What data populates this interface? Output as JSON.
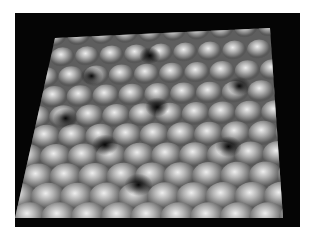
{
  "image": {
    "description": "3D rendered surface topography showing a lattice of rounded bumps with dark pits, grayscale, on black background",
    "background_color": "#050505",
    "surface_base_color": "#6e6e6e",
    "highlight_color": "#e6e6e6",
    "grid": {
      "rows": 9,
      "cols": 9
    }
  }
}
